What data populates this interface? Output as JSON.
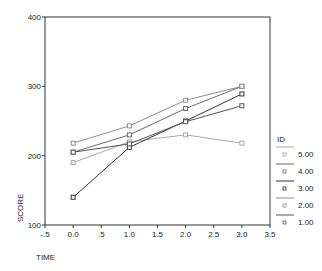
{
  "chart_data": {
    "type": "line",
    "title": "",
    "xlabel": "TIME",
    "ylabel": "SCORE",
    "xlim": [
      -0.5,
      3.5
    ],
    "ylim": [
      100,
      400
    ],
    "x_ticks": [
      "-.5",
      "0.0",
      ".5",
      "1.0",
      "1.5",
      "2.0",
      "2.5",
      "3.0",
      "3.5"
    ],
    "y_ticks": [
      "100",
      "200",
      "300",
      "400"
    ],
    "grid": false,
    "legend_title": "ID",
    "legend_position": "right",
    "x": [
      0,
      1,
      2,
      3
    ],
    "series": [
      {
        "name": "5.00",
        "values": [
          190,
          220,
          230,
          218
        ],
        "color": "#a8a8a8"
      },
      {
        "name": "4.00",
        "values": [
          205,
          230,
          268,
          300
        ],
        "color": "#6a6a6a"
      },
      {
        "name": "3.00",
        "values": [
          140,
          212,
          250,
          289
        ],
        "color": "#333333"
      },
      {
        "name": "2.00",
        "values": [
          218,
          243,
          280,
          300
        ],
        "color": "#909090"
      },
      {
        "name": "1.00",
        "values": [
          205,
          217,
          249,
          272
        ],
        "color": "#555555"
      }
    ]
  }
}
